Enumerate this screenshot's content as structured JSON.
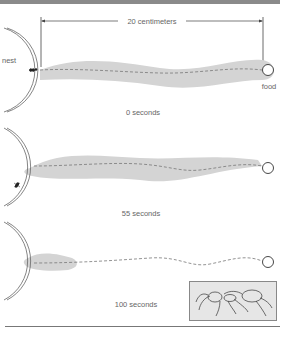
{
  "figure": {
    "distance_label": "20 centimeters",
    "nest_label": "nest",
    "food_label": "food",
    "panels": [
      {
        "time_label": "0 seconds",
        "trail_state": "full pheromone trail from nest to food",
        "ant_position": "at nest entrance"
      },
      {
        "time_label": "55 seconds",
        "trail_state": "full pheromone trail, slightly thinner",
        "ant_position": "inside nest"
      },
      {
        "time_label": "100 seconds",
        "trail_state": "pheromone trail evaporated except near nest",
        "ant_position": "none visible"
      }
    ],
    "inset": {
      "description": "ant illustration"
    },
    "colors": {
      "trail": "#d4d4d4",
      "path": "#777777",
      "nest_outline": "#666666",
      "top_rule": "#8a8a8a",
      "inset_bg": "#e6e6e6"
    }
  }
}
